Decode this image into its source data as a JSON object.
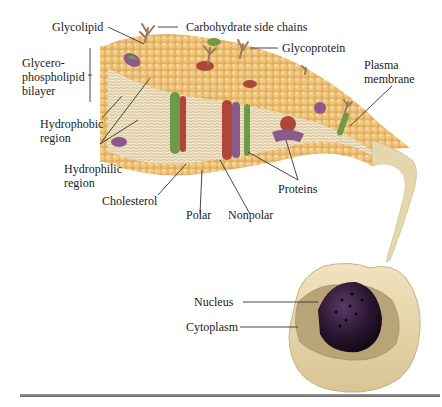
{
  "figure": {
    "labels": {
      "glycolipid": "Glycolipid",
      "carbohydrate_side_chains": "Carbohydrate side chains",
      "glycoprotein": "Glycoprotein",
      "plasma_membrane_1": "Plasma",
      "plasma_membrane_2": "membrane",
      "bilayer_1": "Glycero-",
      "bilayer_2": "phospholipid",
      "bilayer_3": "bilayer",
      "hydrophobic_1": "Hydrophobic",
      "hydrophobic_2": "region",
      "hydrophilic_1": "Hydrophilic",
      "hydrophilic_2": "region",
      "cholesterol": "Cholesterol",
      "polar": "Polar",
      "nonpolar": "Nonpolar",
      "proteins": "Proteins",
      "nucleus": "Nucleus",
      "cytoplasm": "Cytoplasm"
    },
    "colors": {
      "head_group": "#e8b86a",
      "head_highlight": "#f6dca6",
      "tail": "#d9c8a0",
      "protein_green": "#6f9a4a",
      "protein_red": "#b0463a",
      "protein_purple": "#8a5a8a",
      "carbohydrate": "#9a7a5a",
      "nucleus": "#2a1530",
      "cytoplasm": "#b9a47a",
      "cell_shell": "#ead9b0",
      "leader_line": "#333333"
    }
  }
}
